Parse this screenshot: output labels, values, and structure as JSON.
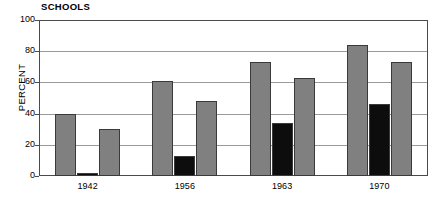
{
  "chart_data": {
    "type": "bar",
    "title": "SCHOOLS",
    "xlabel": "",
    "ylabel": "PERCENT",
    "ylim": [
      0,
      100
    ],
    "yticks": [
      0,
      20,
      40,
      60,
      80,
      100
    ],
    "ytick_labels": [
      "0",
      "20",
      "40",
      "60",
      "80",
      "100"
    ],
    "grid": true,
    "legend": "none",
    "categories": [
      "1942",
      "1956",
      "1963",
      "1970"
    ],
    "series": [
      {
        "name": "series-1",
        "color": "#808080",
        "values": [
          40,
          61,
          73,
          84
        ]
      },
      {
        "name": "series-2",
        "color": "#0d0d0d",
        "values": [
          2,
          13,
          34,
          46
        ]
      },
      {
        "name": "series-3",
        "color": "#808080",
        "values": [
          30,
          48,
          63,
          73
        ]
      }
    ],
    "colors": {
      "gray": "#808080",
      "black": "#0d0d0d",
      "frame": "#4a4a4a",
      "gridline": "#9a9a9a",
      "background": "#ffffff"
    }
  }
}
